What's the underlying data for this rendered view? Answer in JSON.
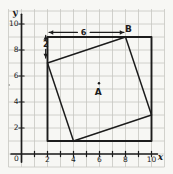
{
  "figure": {
    "canvas": {
      "w": 173,
      "h": 174,
      "paper_color": "#f7f7f4",
      "grid_color": "#c6c6c2",
      "ink_color": "#1c1c1c"
    },
    "mapping": {
      "origin_px": [
        21.5,
        154
      ],
      "unit_px": 13.0
    },
    "grid": {
      "x_lines": {
        "from": -1,
        "to": 11
      },
      "y_lines": {
        "from": -1,
        "to": 11
      },
      "v_span_px": [
        9,
        167
      ],
      "h_span_px": [
        8.5,
        164.5
      ]
    },
    "axes": {
      "x": {
        "label": "x",
        "line": [
          [
            -0.8,
            0
          ],
          [
            10.45,
            0
          ]
        ],
        "label_pos_px": [
          160.5,
          156.5
        ],
        "tilt": 0
      },
      "y": {
        "label": "y",
        "line": [
          [
            0,
            -0.62
          ],
          [
            0,
            10.75
          ]
        ],
        "label_pos_px": [
          15,
          12.5
        ],
        "tilt": -8
      },
      "origin": {
        "label": "0",
        "pos_px": [
          16.5,
          158.5
        ]
      },
      "x_ticks": [
        1,
        2,
        3,
        4,
        5,
        6,
        7,
        8,
        9,
        10
      ],
      "y_ticks": [
        2,
        4,
        6,
        8,
        10
      ],
      "x_tick_labels": [
        {
          "value": 2,
          "text": "2"
        },
        {
          "value": 4,
          "text": "4"
        },
        {
          "value": 6,
          "text": "6"
        },
        {
          "value": 8,
          "text": "8"
        },
        {
          "value": 10,
          "text": "10"
        }
      ],
      "y_tick_labels": [
        {
          "value": 2,
          "text": "2"
        },
        {
          "value": 4,
          "text": "4"
        },
        {
          "value": 6,
          "text": "6"
        },
        {
          "value": 8,
          "text": "8"
        },
        {
          "value": 10,
          "text": "10"
        }
      ]
    },
    "outer_square": {
      "vertices": [
        [
          2,
          1
        ],
        [
          10,
          1
        ],
        [
          10,
          9
        ],
        [
          2,
          9
        ]
      ],
      "stroke_w": 1.9
    },
    "inner_square": {
      "vertices": [
        [
          2,
          7
        ],
        [
          8,
          9
        ],
        [
          10,
          3
        ],
        [
          4,
          1
        ]
      ],
      "stroke_w": 1.5
    },
    "points": [
      {
        "name": "A",
        "label": "A",
        "dot": [
          5.96,
          5.45
        ],
        "label_pos": [
          5.9,
          4.78
        ],
        "tilt": 0
      },
      {
        "name": "B",
        "label": "B",
        "dot": null,
        "label_pos": [
          8.22,
          9.62
        ],
        "tilt": 0
      }
    ],
    "dim_arrows": [
      {
        "label": "6",
        "tilt": -4,
        "segments": [
          [
            [
              2.12,
              9.35
            ],
            [
              4.3,
              9.35
            ]
          ],
          [
            [
              5.28,
              9.35
            ],
            [
              7.88,
              9.35
            ]
          ]
        ],
        "heads": [
          {
            "tip": [
              2.12,
              9.35
            ],
            "dir": [
              -1,
              0
            ]
          },
          {
            "tip": [
              7.88,
              9.35
            ],
            "dir": [
              1,
              0
            ]
          }
        ],
        "label_pos": [
          4.77,
          9.35
        ]
      },
      {
        "label": "2",
        "tilt": 0,
        "segments": [
          [
            [
              1.86,
              9.12
            ],
            [
              1.86,
              8.82
            ]
          ],
          [
            [
              1.86,
              8.05
            ],
            [
              1.86,
              7.38
            ]
          ]
        ],
        "heads": [
          {
            "tip": [
              1.86,
              9.12
            ],
            "dir": [
              0,
              1
            ]
          },
          {
            "tip": [
              1.86,
              7.38
            ],
            "dir": [
              0,
              -1
            ]
          }
        ],
        "label_pos": [
          1.86,
          8.42
        ]
      }
    ],
    "stray_mark_px": [
      9.3,
      85
    ]
  }
}
